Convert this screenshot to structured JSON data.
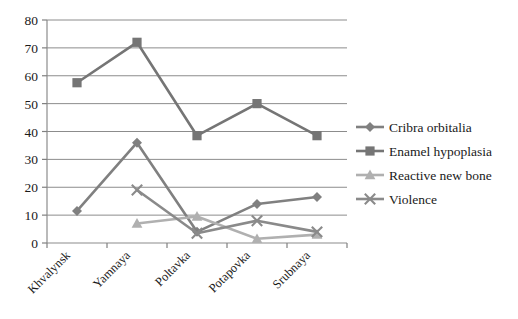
{
  "chart_data": {
    "type": "line",
    "title": "",
    "xlabel": "",
    "ylabel": "",
    "categories": [
      "Khvalynsk",
      "Yamnaya",
      "Poltavka",
      "Potapovka",
      "Srubnaya"
    ],
    "ylim": [
      0,
      80
    ],
    "yticks": [
      0,
      10,
      20,
      30,
      40,
      50,
      60,
      70,
      80
    ],
    "ytick_labels": [
      "0",
      "10",
      "20",
      "30",
      "40",
      "50",
      "60",
      "70",
      "80"
    ],
    "grid": "horizontal",
    "legend_position": "right",
    "series": [
      {
        "name": "Cribra orbitalia",
        "marker": "diamond",
        "color": "#808080",
        "values": [
          11.5,
          36,
          4,
          14,
          16.5
        ]
      },
      {
        "name": "Enamel hypoplasia",
        "marker": "square",
        "color": "#757575",
        "values": [
          57.5,
          72,
          38.5,
          50,
          38.5
        ]
      },
      {
        "name": "Reactive new bone",
        "marker": "triangle",
        "color": "#b0b0b0",
        "values": [
          null,
          7,
          9.5,
          1.5,
          3
        ]
      },
      {
        "name": "Violence",
        "marker": "x",
        "color": "#8a8a8a",
        "values": [
          null,
          19,
          3.5,
          8,
          4
        ]
      }
    ]
  },
  "axes": {
    "axis_color": "#808080",
    "grid_color": "#8c8c8c"
  },
  "legend": {
    "items": [
      {
        "label": "Cribra orbitalia",
        "marker": "diamond",
        "color": "#808080"
      },
      {
        "label": "Enamel hypoplasia",
        "marker": "square",
        "color": "#757575"
      },
      {
        "label": "Reactive new bone",
        "marker": "triangle",
        "color": "#b0b0b0"
      },
      {
        "label": "Violence",
        "marker": "x",
        "color": "#8a8a8a"
      }
    ]
  }
}
